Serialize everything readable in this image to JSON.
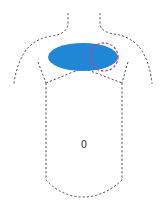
{
  "diagram": {
    "type": "body-chest-outline",
    "regions": {
      "chest_marker": {
        "shape": "ellipse",
        "color": "#1f87d6"
      },
      "highlight_circle": {
        "shape": "dashed-circle",
        "color": "#d9338f"
      }
    },
    "torso_label": "0"
  }
}
